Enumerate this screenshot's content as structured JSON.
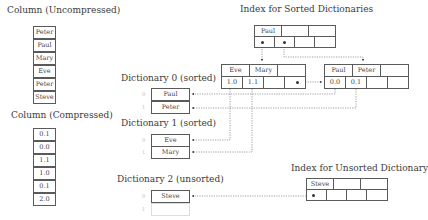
{
  "titles": {
    "uncompressed": "Column (Uncompressed)",
    "compressed": "Column (Compressed)",
    "sorted_index": "Index for Sorted Dictionaries",
    "dict0": "Dictionary 0 (sorted)",
    "dict1": "Dictionary 1 (sorted)",
    "dict2": "Dictionary 2 (unsorted)",
    "unsorted_index": "Index for Unsorted Dictionary"
  },
  "uncompressed_column": [
    "Peter",
    "Paul",
    "Mary",
    "Eve",
    "Peter",
    "Steve"
  ],
  "compressed_column": [
    "0.1",
    "0.0",
    "1.1",
    "1.0",
    "0.1",
    "2.0"
  ],
  "sorted_index": {
    "keys": [
      "Paul",
      "",
      ""
    ],
    "pointers": [
      "•",
      "•",
      "",
      ""
    ]
  },
  "sorted_leaf_left": {
    "keys": [
      "Eve",
      "Mary",
      ""
    ],
    "values": [
      "1.0",
      "1.1",
      "",
      "•"
    ]
  },
  "sorted_leaf_right": {
    "keys": [
      "Paul",
      "Peter",
      ""
    ],
    "values": [
      "0.0",
      "0.1",
      "",
      ""
    ]
  },
  "dict0": {
    "indices": [
      "0",
      "1"
    ],
    "values": [
      "Paul",
      "Peter"
    ]
  },
  "dict1": {
    "indices": [
      "0",
      "1"
    ],
    "values": [
      "Eve",
      "Mary"
    ]
  },
  "dict2": {
    "indices": [
      "0",
      "1"
    ],
    "values": [
      "Steve",
      ""
    ]
  },
  "unsorted_index": {
    "keys": [
      "Steve",
      "",
      ""
    ],
    "pointers": [
      "•",
      "",
      "",
      ""
    ]
  }
}
